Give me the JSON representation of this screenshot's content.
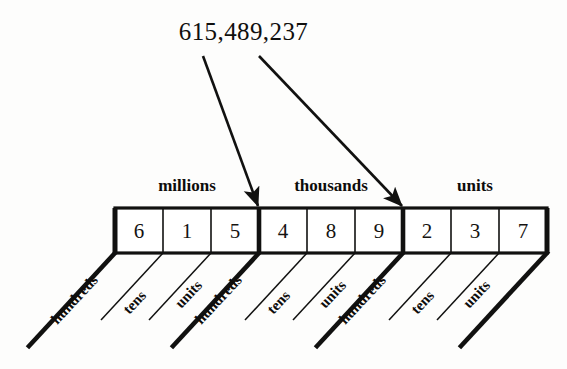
{
  "diagram": {
    "title_number": "615,489,237",
    "colors": {
      "ink": "#111110",
      "background": "#fdfdfc",
      "box_fill": "#ffffff"
    },
    "group_labels": [
      {
        "label": "millions",
        "center_x": 187,
        "y": 176
      },
      {
        "label": "thousands",
        "center_x": 331,
        "y": 176
      },
      {
        "label": "units",
        "center_x": 475,
        "y": 176
      }
    ],
    "digits": [
      {
        "value": "6",
        "center_x": 139,
        "center_y": 231
      },
      {
        "value": "1",
        "center_x": 187,
        "center_y": 231
      },
      {
        "value": "5",
        "center_x": 235,
        "center_y": 231
      },
      {
        "value": "4",
        "center_x": 283,
        "center_y": 231
      },
      {
        "value": "8",
        "center_x": 331,
        "center_y": 231
      },
      {
        "value": "9",
        "center_x": 379,
        "center_y": 231
      },
      {
        "value": "2",
        "center_x": 427,
        "center_y": 231
      },
      {
        "value": "3",
        "center_x": 475,
        "center_y": 231
      },
      {
        "value": "7",
        "center_x": 523,
        "center_y": 231
      }
    ],
    "place_labels": [
      {
        "label": "hundreds",
        "x": 54,
        "y": 322,
        "emphasis": "bold-rule"
      },
      {
        "label": "tens",
        "x": 126,
        "y": 312,
        "emphasis": "thin-rule"
      },
      {
        "label": "units",
        "x": 178,
        "y": 306,
        "emphasis": "thin-rule"
      },
      {
        "label": "hundreds",
        "x": 198,
        "y": 322,
        "emphasis": "bold-rule"
      },
      {
        "label": "tens",
        "x": 270,
        "y": 312,
        "emphasis": "thin-rule"
      },
      {
        "label": "units",
        "x": 322,
        "y": 306,
        "emphasis": "thin-rule"
      },
      {
        "label": "hundreds",
        "x": 342,
        "y": 322,
        "emphasis": "bold-rule"
      },
      {
        "label": "tens",
        "x": 414,
        "y": 312,
        "emphasis": "thin-rule"
      },
      {
        "label": "units",
        "x": 466,
        "y": 306,
        "emphasis": "bold-rule"
      }
    ],
    "leader_lines": [
      {
        "thick": true,
        "x1": 115,
        "y1": 253,
        "x2": 29,
        "y2": 346
      },
      {
        "thick": false,
        "x1": 163,
        "y1": 253,
        "x2": 101,
        "y2": 320
      },
      {
        "thick": false,
        "x1": 211,
        "y1": 253,
        "x2": 149,
        "y2": 320
      },
      {
        "thick": true,
        "x1": 259,
        "y1": 253,
        "x2": 173,
        "y2": 346
      },
      {
        "thick": false,
        "x1": 307,
        "y1": 253,
        "x2": 245,
        "y2": 320
      },
      {
        "thick": false,
        "x1": 355,
        "y1": 253,
        "x2": 293,
        "y2": 320
      },
      {
        "thick": true,
        "x1": 403,
        "y1": 253,
        "x2": 317,
        "y2": 346
      },
      {
        "thick": false,
        "x1": 451,
        "y1": 253,
        "x2": 389,
        "y2": 320
      },
      {
        "thick": false,
        "x1": 499,
        "y1": 253,
        "x2": 437,
        "y2": 320
      },
      {
        "thick": true,
        "x1": 547,
        "y1": 253,
        "x2": 461,
        "y2": 346
      }
    ],
    "arrows": [
      {
        "name": "arrow-to-millions-thousands-divider",
        "x1": 203,
        "y1": 56,
        "x2": 258,
        "y2": 206
      },
      {
        "name": "arrow-to-thousands-units-divider",
        "x1": 259,
        "y1": 56,
        "x2": 402,
        "y2": 206
      }
    ],
    "box_row": {
      "left": 115,
      "top": 208,
      "cell_width": 48,
      "cell_height": 45,
      "cell_count": 9,
      "group_divider_x": [
        259,
        403
      ]
    }
  }
}
